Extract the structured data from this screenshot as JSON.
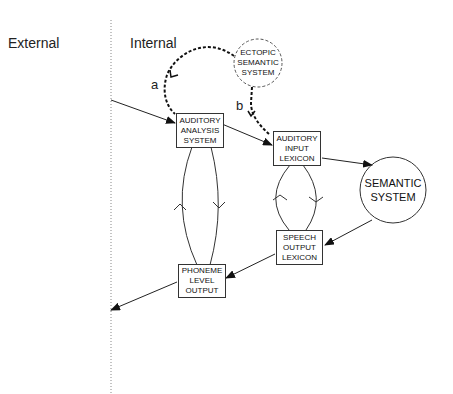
{
  "regions": {
    "external": "External",
    "internal": "Internal"
  },
  "nodes": {
    "ectopic": {
      "line1": "ECTOPIC",
      "line2": "SEMANTIC",
      "line3": "SYSTEM"
    },
    "auditory_analysis": {
      "line1": "AUDITORY",
      "line2": "ANALYSIS",
      "line3": "SYSTEM"
    },
    "auditory_input": {
      "line1": "AUDITORY",
      "line2": "INPUT",
      "line3": "LEXICON"
    },
    "semantic": {
      "line1": "SEMANTIC",
      "line2": "SYSTEM"
    },
    "speech_output": {
      "line1": "SPEECH",
      "line2": "OUTPUT",
      "line3": "LEXICON"
    },
    "phoneme": {
      "line1": "PHONEME",
      "line2": "LEVEL",
      "line3": "OUTPUT"
    }
  },
  "routes": {
    "a": "a",
    "b": "b"
  }
}
